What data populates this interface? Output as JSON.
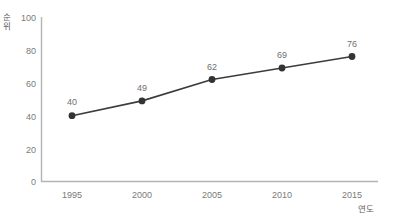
{
  "chart_data": {
    "type": "line",
    "title": "",
    "xlabel": "연도",
    "ylabel": "순위",
    "ylabel_lines": [
      "순",
      "위"
    ],
    "categories": [
      "1995",
      "2000",
      "2005",
      "2010",
      "2015"
    ],
    "x": [
      1995,
      2000,
      2005,
      2010,
      2015
    ],
    "values": [
      40,
      49,
      62,
      69,
      76
    ],
    "point_labels": [
      "40",
      "49",
      "62",
      "69",
      "76"
    ],
    "yticks": [
      "0",
      "20",
      "40",
      "60",
      "80",
      "100"
    ],
    "ytick_values": [
      0,
      20,
      40,
      60,
      80,
      100
    ],
    "ylim": [
      0,
      100
    ],
    "xlim": [
      1995,
      2015
    ],
    "grid": false,
    "legend": "none",
    "series": [
      {
        "name": "순위",
        "values": [
          40,
          49,
          62,
          69,
          76
        ]
      }
    ],
    "colors": {
      "line": "#3c3c3c",
      "marker": "#333333",
      "axis": "#b0b0b0",
      "text": "#737373",
      "background": "#ffffff"
    }
  }
}
